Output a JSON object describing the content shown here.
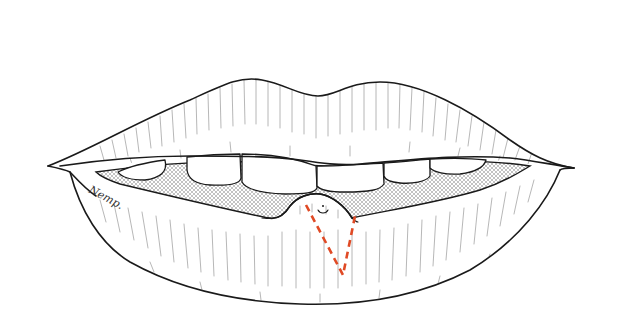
{
  "figure": {
    "annotation": {
      "type": "wedge-excision-outline",
      "style": "dashed",
      "location": "lower lip, center",
      "color": "#e04a25"
    },
    "lesion": {
      "location": "lower lip vermilion, center",
      "shape": "rounded mound with small central marking"
    },
    "signature": "Nemp.",
    "colors": {
      "line": "#1a1a1a",
      "background": "#ffffff",
      "oral_shading": "#9a9a9a",
      "excision": "#e04a25"
    }
  }
}
